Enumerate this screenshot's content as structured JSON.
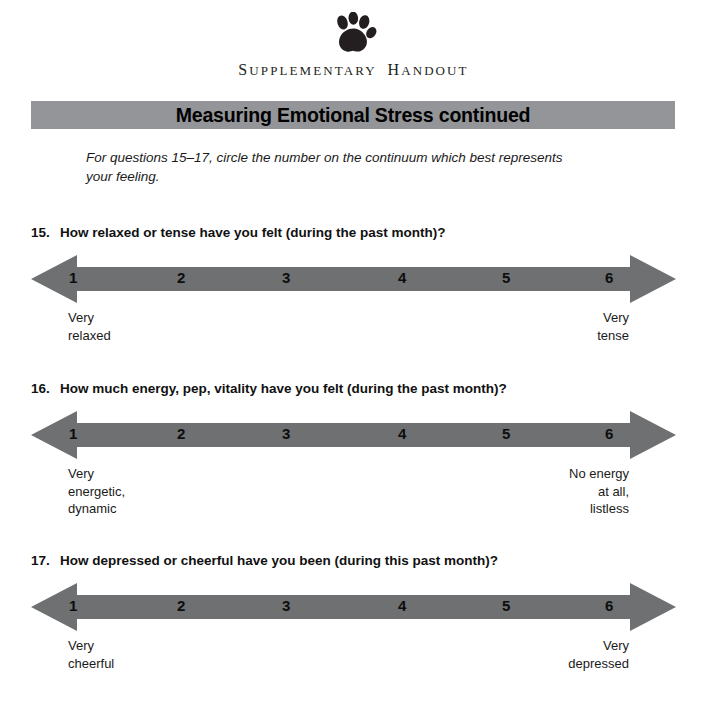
{
  "masthead": {
    "logo_icon": "paw-print-icon",
    "label_first_letter": "S",
    "label_rest_word1": "upplementary",
    "label_second_letter": "H",
    "label_rest_word2": "andout",
    "label_full": "Supplementary Handout"
  },
  "banner": {
    "title": "Measuring Emotional Stress continued",
    "background_color": "#939598",
    "text_color": "#000000"
  },
  "instruction": {
    "text": "For questions 15–17, circle the number on the continuum which best represents your feeling."
  },
  "scale": {
    "numbers": [
      "1",
      "2",
      "3",
      "4",
      "5",
      "6"
    ],
    "arrow_color": "#6e7072"
  },
  "questions": [
    {
      "number": "15.",
      "text": "How relaxed or tense have you felt (during the past month)?",
      "anchor_left": "Very\nrelaxed",
      "anchor_right": "Very\ntense"
    },
    {
      "number": "16.",
      "text": "How much energy, pep, vitality have you felt (during the past month)?",
      "anchor_left": "Very\nenergetic,\ndynamic",
      "anchor_right": "No energy\nat all,\nlistless"
    },
    {
      "number": "17.",
      "text": "How depressed or cheerful have you been (during this past month)?",
      "anchor_left": "Very\ncheerful",
      "anchor_right": "Very\ndepressed"
    }
  ]
}
